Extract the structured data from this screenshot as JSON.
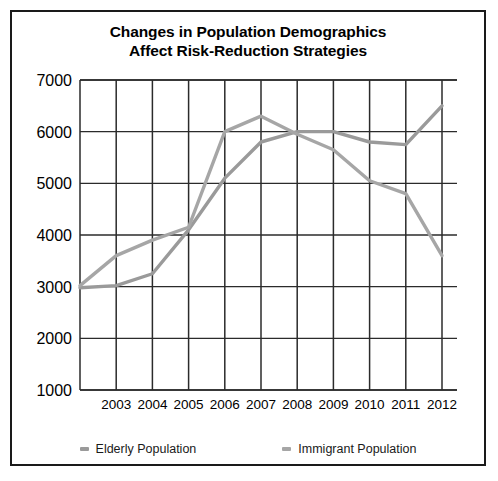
{
  "chart_data": {
    "type": "line",
    "title": "Changes in Population Demographics Affect Risk-Reduction Strategies",
    "title_lines": [
      "Changes in Population Demographics",
      "Affect Risk-Reduction Strategies"
    ],
    "xlabel": "",
    "ylabel": "",
    "categories": [
      "",
      "2003",
      "2004",
      "2005",
      "2006",
      "2007",
      "2008",
      "2009",
      "2010",
      "2011",
      "2012"
    ],
    "tick_labels_x": [
      "2003",
      "2004",
      "2005",
      "2006",
      "2007",
      "2008",
      "2009",
      "2010",
      "2011",
      "2012"
    ],
    "tick_labels_y": [
      "1000",
      "2000",
      "3000",
      "4000",
      "5000",
      "6000",
      "7000"
    ],
    "ylim": [
      1000,
      7000
    ],
    "ytick_step": 1000,
    "grid": true,
    "legend_position": "bottom",
    "series": [
      {
        "name": "Elderly Population",
        "color": "#9a9a9a",
        "values": [
          2980,
          3020,
          3250,
          4100,
          5100,
          5800,
          6000,
          6000,
          5800,
          5750,
          6500
        ]
      },
      {
        "name": "Immigrant Population",
        "color": "#a6a6a6",
        "values": [
          3020,
          3600,
          3900,
          4150,
          6000,
          6300,
          5950,
          5650,
          5050,
          4800,
          3600
        ]
      }
    ]
  },
  "style": {
    "border_color": "#1a1a1a",
    "grid_color": "#2b2b2b",
    "background": "#ffffff",
    "text_color": "#000000"
  }
}
